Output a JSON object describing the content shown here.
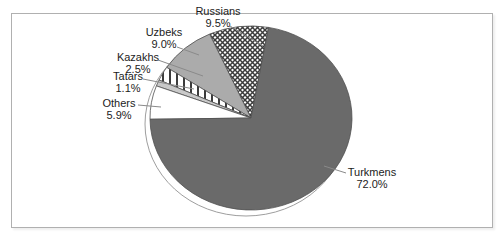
{
  "chart_data": {
    "type": "pie",
    "title": "",
    "legend_position": "callouts",
    "slices": [
      {
        "label": "Russians",
        "value": 9.5,
        "pct_label": "9.5%",
        "fill": "crosshatch",
        "callout": {
          "x": 218,
          "y": 6
        },
        "leader": [
          230,
          26,
          263,
          46
        ]
      },
      {
        "label": "Uzbeks",
        "value": 9.0,
        "pct_label": "9.0%",
        "fill": "#ababab",
        "callout": {
          "x": 164,
          "y": 27
        },
        "leader": [
          177,
          47,
          199,
          55
        ]
      },
      {
        "label": "Kazakhs",
        "value": 2.5,
        "pct_label": "2.5%",
        "fill": "vlines",
        "callout": {
          "x": 138,
          "y": 52
        },
        "leader": [
          158,
          60,
          203,
          76
        ]
      },
      {
        "label": "Tatars",
        "value": 1.1,
        "pct_label": "1.1%",
        "fill": "#c9c9c9",
        "callout": {
          "x": 128,
          "y": 71
        },
        "leader": [
          143,
          79,
          194,
          89
        ]
      },
      {
        "label": "Others",
        "value": 5.9,
        "pct_label": "5.9%",
        "fill": "#ffffff",
        "callout": {
          "x": 119,
          "y": 98
        },
        "leader": [
          138,
          105,
          161,
          107
        ]
      },
      {
        "label": "Turkmens",
        "value": 72.0,
        "pct_label": "72.0%",
        "fill": "#6a6a6a",
        "callout": {
          "x": 372,
          "y": 167
        },
        "leader": [
          324,
          166,
          346,
          173
        ]
      }
    ],
    "layout": {
      "start_angle_deg": 10,
      "direction": "counterclockwise",
      "center": [
        251,
        118
      ],
      "rx": 101,
      "ry": 92,
      "shadow_offset": [
        -5,
        6
      ],
      "wedge_stroke": "#4f4f4f",
      "pattern_line_color": "#3c3c3c",
      "leader_color": "#8a8a8a",
      "shadow_stroke": "#9e9e9e",
      "frame_border": "#b0b0b0"
    }
  }
}
